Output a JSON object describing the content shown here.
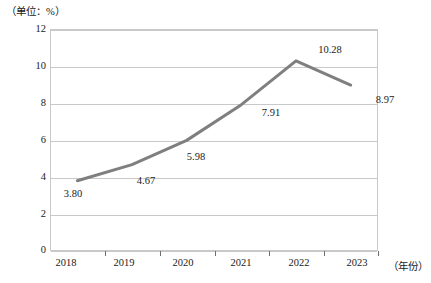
{
  "chart_data": {
    "type": "line",
    "title": "",
    "subtitle": "",
    "unit_note": "（单位：%）",
    "xlabel": "（年份）",
    "ylabel": "",
    "categories": [
      "2018",
      "2019",
      "2020",
      "2021",
      "2022",
      "2023"
    ],
    "values": [
      3.8,
      4.67,
      5.98,
      7.91,
      10.28,
      8.97
    ],
    "data_labels": [
      "3.80",
      "4.67",
      "5.98",
      "7.91",
      "10.28",
      "8.97"
    ],
    "ylim": [
      0,
      12
    ],
    "yticks": [
      "0",
      "2",
      "4",
      "6",
      "8",
      "10",
      "12"
    ],
    "ytick_values": [
      0,
      2,
      4,
      6,
      8,
      10,
      12
    ],
    "grid": true,
    "grid_axis": "y",
    "legend": false,
    "legend_position": "none",
    "series": [
      {
        "name": "",
        "values": [
          3.8,
          4.67,
          5.98,
          7.91,
          10.28,
          8.97
        ],
        "color": "#7f7f7f",
        "line_width": 3,
        "markers": false
      }
    ],
    "colors": {
      "line": "#7f7f7f",
      "grid": "#c9c9c9",
      "axis": "#c9c9c9",
      "text": "#1a1a1a",
      "background": "#ffffff"
    }
  }
}
